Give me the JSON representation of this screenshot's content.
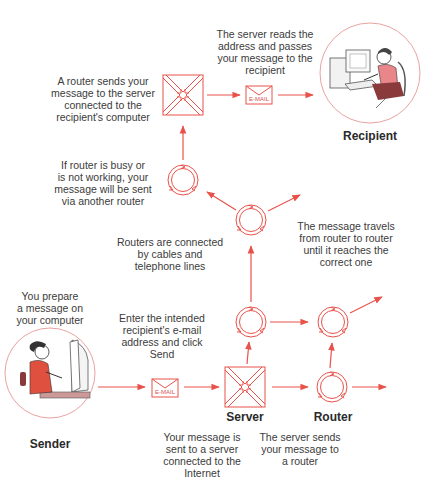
{
  "diagram": {
    "accent_color": "#e8524a",
    "nodes": {
      "sender": {
        "label": "Sender",
        "caption": "You prepare\na message on\nyour computer"
      },
      "recipient": {
        "label": "Recipient"
      },
      "server_bottom": {
        "label": "Server",
        "caption": "Your message is\nsent to a server\nconnected to the\nInternet"
      },
      "router_bottom": {
        "label": "Router",
        "caption": "The server sends\nyour message to\na router"
      },
      "email_bottom": {
        "label": "E-MAIL",
        "caption": "Enter the intended\nrecipient's e-mail\naddress and click\nSend"
      },
      "email_top": {
        "label": "E-MAIL",
        "caption": "The server reads the\naddress and passes\nyour message to the\nrecipient"
      },
      "server_top": {
        "caption": "A router sends your\nmessage to the server\nconnected to the\nrecipient's computer"
      },
      "router_busy": {
        "caption": "If router is busy or\nis not working, your\nmessage will be sent\nvia another router"
      },
      "router_connected": {
        "caption": "Routers are connected\nby cables and\ntelephone lines"
      },
      "router_travel": {
        "caption": "The message travels\nfrom router to router\nuntil it reaches the\ncorrect one"
      }
    }
  }
}
